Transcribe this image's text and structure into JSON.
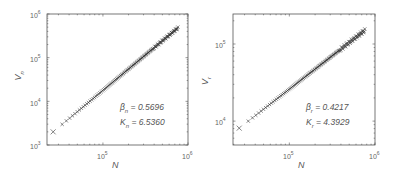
{
  "chart_data": [
    {
      "type": "scatter",
      "title": "",
      "xlabel": "N",
      "ylabel": "V_n",
      "ylabel_main": "V",
      "ylabel_sub": "n",
      "xscale": "log",
      "yscale": "log",
      "xlim": [
        22000,
        1000000
      ],
      "ylim": [
        1000,
        1000000
      ],
      "x_ticks": [
        {
          "base": "10",
          "exp": "5",
          "value": 100000
        },
        {
          "base": "10",
          "exp": "6",
          "value": 1000000
        }
      ],
      "y_ticks": [
        {
          "base": "10",
          "exp": "3",
          "value": 1000
        },
        {
          "base": "10",
          "exp": "4",
          "value": 10000
        },
        {
          "base": "10",
          "exp": "5",
          "value": 100000
        },
        {
          "base": "10",
          "exp": "6",
          "value": 1000000
        }
      ],
      "marker": "x",
      "series": [
        {
          "name": "V_n vs N",
          "x_start": 26000,
          "x_end": 760000,
          "y_start": 2000,
          "y_end": 480000,
          "n_points": 120
        }
      ],
      "annotation": {
        "beta_symbol": "β",
        "beta_sub": "n",
        "beta_value": " = 0.5696",
        "k_symbol": "K",
        "k_sub": "n",
        "k_value": " = 6.5360"
      },
      "grid": false
    },
    {
      "type": "scatter",
      "title": "",
      "xlabel": "N",
      "ylabel": "V_r",
      "ylabel_main": "V",
      "ylabel_sub": "r",
      "xscale": "log",
      "yscale": "log",
      "xlim": [
        22000,
        1000000
      ],
      "ylim": [
        4900,
        245000
      ],
      "x_ticks": [
        {
          "base": "10",
          "exp": "5",
          "value": 100000
        },
        {
          "base": "10",
          "exp": "6",
          "value": 1000000
        }
      ],
      "y_ticks": [
        {
          "base": "10",
          "exp": "4",
          "value": 10000
        },
        {
          "base": "10",
          "exp": "5",
          "value": 100000
        }
      ],
      "marker": "x",
      "series": [
        {
          "name": "V_r vs N",
          "x_start": 26000,
          "x_end": 760000,
          "y_start": 8100,
          "y_end": 150000,
          "n_points": 120
        }
      ],
      "annotation": {
        "beta_symbol": "β",
        "beta_sub": "r",
        "beta_value": " = 0.4217",
        "k_symbol": "K",
        "k_sub": "r",
        "k_value": " = 4.3929"
      },
      "grid": false
    }
  ],
  "colors": {
    "axis": "#555555",
    "marker": "#333333",
    "text": "#555555"
  }
}
